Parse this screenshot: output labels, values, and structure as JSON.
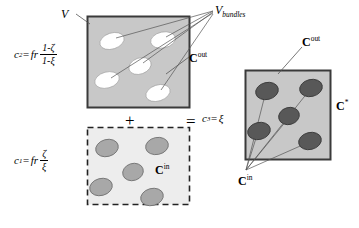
{
  "figure": {
    "type": "diagram",
    "colors": {
      "box_fill_gray": "#c8c8c8",
      "box_border_dark": "#3a3a3a",
      "dashed_border": "#222222",
      "ellipse_white": "#ffffff",
      "ellipse_light_gray": "#a8a8a8",
      "ellipse_dark_gray": "#585858",
      "line": "#555555",
      "text": "#000000",
      "background": "#ffffff"
    }
  },
  "labels": {
    "v": "V",
    "v_bundles_base": "V",
    "v_bundles_sub": "bundles",
    "c_out_top_base": "C",
    "c_out_top_sup": "out",
    "c_in_dashed_base": "C",
    "c_in_dashed_sup": "in",
    "c_out_right_base": "C",
    "c_out_right_sup": "out",
    "c_star_base": "C",
    "c_star_sup": "*",
    "c_in_right_base": "C",
    "c_in_right_sup": "in"
  },
  "operators": {
    "plus": "+",
    "equals": "="
  },
  "formulas": {
    "c2": {
      "lhs": "c",
      "lhs_sub": "2",
      "eq": "=",
      "coef": "fr",
      "numerator": "1-ζ",
      "denominator": "1-ξ",
      "plain": "c2 = fr (1-ζ)/(1-ξ)"
    },
    "c1": {
      "lhs": "c",
      "lhs_sub": "1",
      "eq": "=",
      "coef": "fr",
      "numerator": "ζ",
      "denominator": "ξ",
      "plain": "c1 = fr ζ/ξ"
    },
    "c3": {
      "lhs": "c",
      "lhs_sub": "3",
      "eq": "=",
      "rhs": "ξ",
      "plain": "c3 = ξ"
    }
  },
  "boxes": {
    "top_solid": {
      "x": 87,
      "y": 16,
      "w": 103,
      "h": 92,
      "style": "solid",
      "fill": "#c8c8c8"
    },
    "bottom_dashed": {
      "x": 87,
      "y": 127,
      "w": 103,
      "h": 78,
      "style": "dashed",
      "fill": "#ededed"
    },
    "right_solid": {
      "x": 245,
      "y": 70,
      "w": 86,
      "h": 90,
      "style": "solid",
      "fill": "#c8c8c8"
    }
  },
  "ellipses": {
    "top_box_white": [
      {
        "cx": 112,
        "cy": 41,
        "rx": 12,
        "ry": 8,
        "rot": -18
      },
      {
        "cx": 163,
        "cy": 40,
        "rx": 12,
        "ry": 8,
        "rot": -12
      },
      {
        "cx": 140,
        "cy": 66,
        "rx": 11,
        "ry": 8,
        "rot": -20
      },
      {
        "cx": 107,
        "cy": 80,
        "rx": 12,
        "ry": 8,
        "rot": -15
      },
      {
        "cx": 158,
        "cy": 93,
        "rx": 12,
        "ry": 8,
        "rot": -18
      }
    ],
    "dashed_box_gray": [
      {
        "cx": 107,
        "cy": 148,
        "rx": 11,
        "ry": 8,
        "rot": -15
      },
      {
        "cx": 157,
        "cy": 146,
        "rx": 11,
        "ry": 8,
        "rot": -12
      },
      {
        "cx": 133,
        "cy": 172,
        "rx": 10,
        "ry": 8,
        "rot": -18
      },
      {
        "cx": 101,
        "cy": 187,
        "rx": 11,
        "ry": 8,
        "rot": -15
      },
      {
        "cx": 152,
        "cy": 196,
        "rx": 11,
        "ry": 8,
        "rot": -15
      }
    ],
    "right_box_dark": [
      {
        "cx": 267,
        "cy": 91,
        "rx": 11,
        "ry": 8,
        "rot": -14
      },
      {
        "cx": 311,
        "cy": 88,
        "rx": 11,
        "ry": 8,
        "rot": -14
      },
      {
        "cx": 289,
        "cy": 116,
        "rx": 10,
        "ry": 8,
        "rot": -16
      },
      {
        "cx": 259,
        "cy": 131,
        "rx": 11,
        "ry": 8,
        "rot": -14
      },
      {
        "cx": 310,
        "cy": 140,
        "rx": 11,
        "ry": 8,
        "rot": -14
      }
    ]
  }
}
